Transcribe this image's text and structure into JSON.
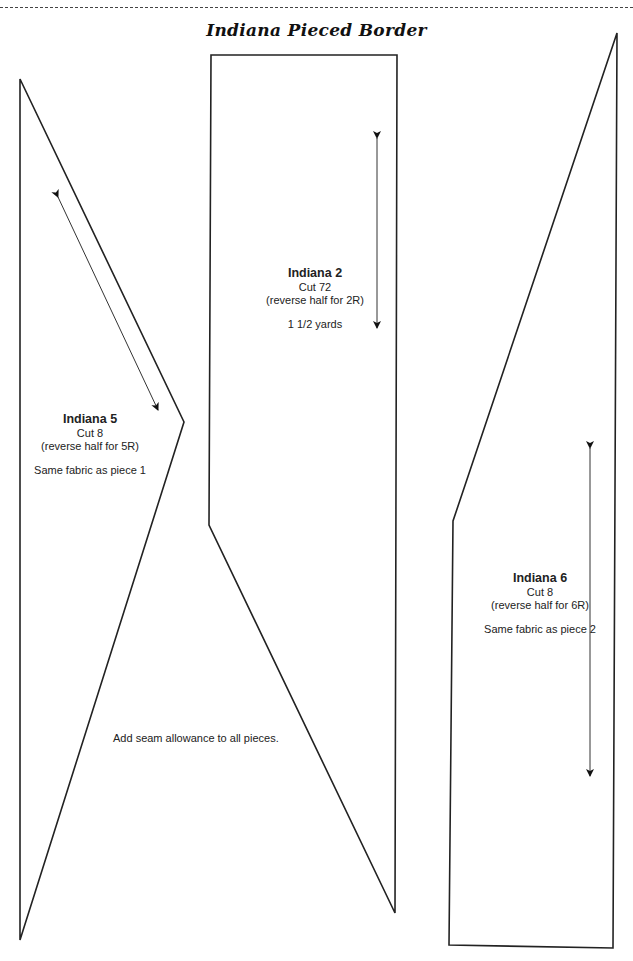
{
  "page": {
    "title": "Indiana Pieced Border",
    "note": "Add seam allowance to all pieces."
  },
  "pieces": [
    {
      "id": "indiana-5",
      "name": "Indiana 5",
      "cut": "Cut 8",
      "reverse": "(reverse half for 5R)",
      "extra": "Same fabric as piece 1",
      "outline": "20,79 184,422 20,940",
      "grainline": {
        "x1": 58,
        "y1": 197,
        "x2": 158,
        "y2": 410
      }
    },
    {
      "id": "indiana-2",
      "name": "Indiana 2",
      "cut": "Cut 72",
      "reverse": "(reverse half for 2R)",
      "extra": "1 1/2 yards",
      "outline": "211,55 397,55 395,913 209,525",
      "grainline": {
        "x1": 377,
        "y1": 138,
        "x2": 377,
        "y2": 328
      }
    },
    {
      "id": "indiana-6",
      "name": "Indiana 6",
      "cut": "Cut 8",
      "reverse": "(reverse half for 6R)",
      "extra": "Same fabric as piece 2",
      "outline": "617,33 613,948 449,945 453,521",
      "grainline": {
        "x1": 590,
        "y1": 448,
        "x2": 590,
        "y2": 776
      }
    }
  ],
  "colors": {
    "line": "#222222",
    "background": "#ffffff"
  }
}
